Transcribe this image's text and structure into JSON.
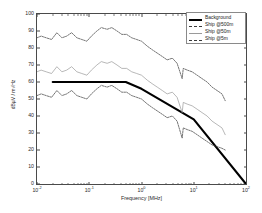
{
  "chart_data": {
    "type": "line",
    "title": "",
    "xlabel": "Frequency [MHz]",
    "ylabel": "dBµV / m√Hz",
    "xscale": "log",
    "xlim": [
      0.01,
      100
    ],
    "ylim": [
      0,
      100
    ],
    "xticks": [
      "10",
      "10",
      "10",
      "10",
      "10"
    ],
    "xtick_exponents": [
      "-2",
      "-1",
      "0",
      "1",
      "2"
    ],
    "yticks": [
      "0",
      "10",
      "20",
      "30",
      "40",
      "50",
      "60",
      "70",
      "80",
      "90",
      "100"
    ],
    "grid": false,
    "legend_position": "top-right",
    "series": [
      {
        "name": "Background",
        "style": "solid-thick",
        "color": "#000000",
        "x": [
          0.02,
          0.5,
          1.0,
          10.0,
          100.0
        ],
        "values": [
          60,
          60,
          56,
          38,
          0
        ]
      },
      {
        "name": "Ship @500m",
        "style": "dashed",
        "color": "#3a3a3a",
        "x": [
          0.01,
          0.012,
          0.015,
          0.019,
          0.024,
          0.03,
          0.037,
          0.046,
          0.058,
          0.072,
          0.09,
          0.11,
          0.14,
          0.17,
          0.22,
          0.27,
          0.34,
          0.42,
          0.52,
          0.65,
          0.81,
          1.0,
          1.3,
          1.6,
          2.0,
          2.5,
          3.1,
          3.9,
          4.8,
          6.0,
          6.3,
          7.5,
          9.3,
          11.6,
          14.4,
          18.0,
          22.4,
          27.9,
          34.7,
          40.0
        ],
        "values": [
          86,
          87,
          86,
          85,
          89,
          86,
          87,
          89,
          86,
          85,
          84,
          87,
          90,
          92,
          91,
          92,
          90,
          88,
          88,
          86,
          85,
          84,
          81,
          79,
          77,
          75,
          73,
          74,
          71,
          62,
          68,
          67,
          66,
          64,
          62,
          60,
          57,
          55,
          53,
          49
        ]
      },
      {
        "name": "Ship @50m",
        "style": "solid",
        "color": "#9a9a9a",
        "x": [
          0.01,
          0.012,
          0.015,
          0.019,
          0.024,
          0.03,
          0.037,
          0.046,
          0.058,
          0.072,
          0.09,
          0.11,
          0.14,
          0.17,
          0.22,
          0.27,
          0.34,
          0.42,
          0.52,
          0.65,
          0.81,
          1.0,
          1.3,
          1.6,
          2.0,
          2.5,
          3.1,
          3.9,
          4.8,
          6.0,
          6.3,
          7.5,
          9.3,
          11.6,
          14.4,
          18.0,
          22.4,
          27.9,
          34.7,
          40.0
        ],
        "values": [
          66,
          67,
          66,
          65,
          69,
          66,
          67,
          69,
          66,
          65,
          64,
          67,
          70,
          72,
          71,
          72,
          70,
          68,
          68,
          66,
          65,
          64,
          61,
          59,
          57,
          55,
          53,
          54,
          51,
          42,
          48,
          47,
          46,
          44,
          42,
          40,
          37,
          35,
          33,
          29
        ]
      },
      {
        "name": "Ship @5m",
        "style": "dashed",
        "color": "#3a3a3a",
        "x": [
          0.01,
          0.012,
          0.015,
          0.019,
          0.024,
          0.03,
          0.037,
          0.046,
          0.058,
          0.072,
          0.09,
          0.11,
          0.14,
          0.17,
          0.22,
          0.27,
          0.34,
          0.42,
          0.52,
          0.65,
          0.81,
          1.0,
          1.3,
          1.6,
          2.0,
          2.5,
          3.1,
          3.9,
          4.8,
          6.0,
          6.3,
          7.5,
          9.3,
          11.6,
          14.4,
          18.0,
          22.4,
          27.9,
          34.7,
          40.0
        ],
        "values": [
          52,
          53,
          52,
          51,
          55,
          52,
          53,
          55,
          52,
          51,
          50,
          53,
          56,
          58,
          57,
          58,
          56,
          54,
          54,
          52,
          51,
          50,
          47,
          45,
          43,
          41,
          39,
          40,
          37,
          27,
          33,
          32,
          31,
          29,
          27,
          25,
          23,
          22,
          21,
          20
        ]
      }
    ]
  }
}
